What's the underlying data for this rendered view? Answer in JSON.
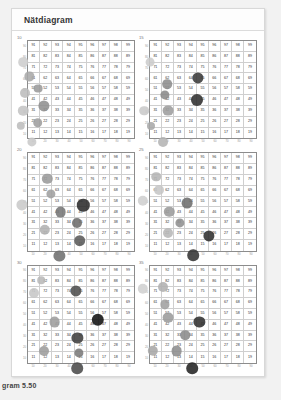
{
  "page": {
    "background": "#f2f2f2",
    "card_background": "#ffffff"
  },
  "header": {
    "title": "Nätdiagram"
  },
  "caption": {
    "text": "gram 5.50"
  },
  "grid_numbers": {
    "rows": [
      [
        91,
        92,
        93,
        94,
        95,
        96,
        97,
        98,
        99
      ],
      [
        81,
        82,
        83,
        84,
        85,
        86,
        87,
        88,
        89
      ],
      [
        71,
        72,
        73,
        74,
        75,
        76,
        77,
        78,
        79
      ],
      [
        61,
        62,
        63,
        64,
        65,
        66,
        67,
        68,
        69
      ],
      [
        51,
        52,
        53,
        54,
        55,
        56,
        57,
        58,
        59
      ],
      [
        41,
        42,
        43,
        44,
        45,
        46,
        47,
        48,
        49
      ],
      [
        31,
        32,
        33,
        34,
        35,
        36,
        37,
        38,
        39
      ],
      [
        21,
        22,
        23,
        24,
        25,
        26,
        27,
        28,
        29
      ],
      [
        11,
        12,
        13,
        14,
        15,
        16,
        17,
        18,
        19
      ]
    ]
  },
  "axes": {
    "y_ticks": [
      "90",
      "80",
      "70",
      "60",
      "50",
      "40",
      "30",
      "20",
      "10"
    ],
    "x_ticks": [
      "10",
      "20",
      "30",
      "40",
      "50",
      "60",
      "70",
      "80",
      "90"
    ]
  },
  "chart_data": {
    "type": "scatter",
    "title": "Nätdiagram",
    "xlabel": "",
    "ylabel": "",
    "xlim": [
      10,
      100
    ],
    "ylim": [
      10,
      100
    ],
    "grid": true,
    "legend": "none",
    "note": "Six small multiples of a 9x9 number grid (11-99) with bubbles of varying size and darkness overlaid.",
    "panels": [
      {
        "label": "10",
        "bubbles": [
          {
            "cx": 14,
            "cy": 8,
            "r": 4.6,
            "color": "#c9c9c9"
          },
          {
            "cx": 5,
            "cy": 22,
            "r": 4.2,
            "color": "#bdbdbd"
          },
          {
            "cx": 19,
            "cy": 25,
            "r": 4.8,
            "color": "#9e9e9e"
          },
          {
            "cx": 7,
            "cy": 36,
            "r": 5.2,
            "color": "#c4c4c4"
          },
          {
            "cx": 24,
            "cy": 40,
            "r": 5.6,
            "color": "#8f8f8f"
          },
          {
            "cx": 8,
            "cy": 52,
            "r": 5.0,
            "color": "#bcbcbc"
          },
          {
            "cx": 19,
            "cy": 56,
            "r": 4.4,
            "color": "#9a9a9a"
          },
          {
            "cx": 12,
            "cy": 67,
            "r": 4.6,
            "color": "#a8a8a8"
          },
          {
            "cx": 7,
            "cy": 80,
            "r": 4.8,
            "color": "#cdcdcd"
          }
        ]
      },
      {
        "label": "15",
        "bubbles": [
          {
            "cx": 22,
            "cy": 8,
            "r": 5.0,
            "color": "#b4b4b4"
          },
          {
            "cx": 12,
            "cy": 22,
            "r": 4.0,
            "color": "#a9a9a9"
          },
          {
            "cx": 6,
            "cy": 36,
            "r": 4.8,
            "color": "#c9c9c9"
          },
          {
            "cx": 26,
            "cy": 36,
            "r": 5.4,
            "color": "#9d9d9d"
          },
          {
            "cx": 23,
            "cy": 50,
            "r": 4.6,
            "color": "#8a8a8a"
          },
          {
            "cx": 50,
            "cy": 46,
            "r": 6.0,
            "color": "#2f2f2f"
          },
          {
            "cx": 25,
            "cy": 60,
            "r": 4.8,
            "color": "#8d8d8d"
          },
          {
            "cx": 51,
            "cy": 66,
            "r": 5.6,
            "color": "#3a3a3a"
          },
          {
            "cx": 11,
            "cy": 80,
            "r": 4.4,
            "color": "#cccccc"
          }
        ]
      },
      {
        "label": "20",
        "bubbles": [
          {
            "cx": 37,
            "cy": 6,
            "r": 5.6,
            "color": "#6f6f6f"
          },
          {
            "cx": 54,
            "cy": 20,
            "r": 5.8,
            "color": "#5a5a5a"
          },
          {
            "cx": 25,
            "cy": 30,
            "r": 5.2,
            "color": "#b2b2b2"
          },
          {
            "cx": 52,
            "cy": 36,
            "r": 5.0,
            "color": "#6c6c6c"
          },
          {
            "cx": 38,
            "cy": 46,
            "r": 5.4,
            "color": "#767676"
          },
          {
            "cx": 6,
            "cy": 52,
            "r": 5.6,
            "color": "#cacaca"
          },
          {
            "cx": 57,
            "cy": 52,
            "r": 6.2,
            "color": "#2b2b2b"
          },
          {
            "cx": 30,
            "cy": 62,
            "r": 4.6,
            "color": "#9f9f9f"
          },
          {
            "cx": 27,
            "cy": 76,
            "r": 5.2,
            "color": "#9a9a9a"
          }
        ]
      },
      {
        "label": "25",
        "bubbles": [
          {
            "cx": 47,
            "cy": 7,
            "r": 5.8,
            "color": "#333333"
          },
          {
            "cx": 26,
            "cy": 27,
            "r": 5.0,
            "color": "#b7b7b7"
          },
          {
            "cx": 60,
            "cy": 24,
            "r": 5.6,
            "color": "#2e2e2e"
          },
          {
            "cx": 36,
            "cy": 36,
            "r": 4.6,
            "color": "#8f8f8f"
          },
          {
            "cx": 27,
            "cy": 46,
            "r": 5.2,
            "color": "#9b9b9b"
          },
          {
            "cx": 42,
            "cy": 54,
            "r": 5.4,
            "color": "#6d6d6d"
          },
          {
            "cx": 5,
            "cy": 56,
            "r": 5.2,
            "color": "#cfcfcf"
          },
          {
            "cx": 18,
            "cy": 66,
            "r": 5.0,
            "color": "#c6c6c6"
          },
          {
            "cx": 16,
            "cy": 78,
            "r": 4.8,
            "color": "#b5b5b5"
          }
        ]
      },
      {
        "label": "30",
        "bubbles": [
          {
            "cx": 52,
            "cy": 6,
            "r": 5.8,
            "color": "#4a4a4a"
          },
          {
            "cx": 24,
            "cy": 22,
            "r": 5.0,
            "color": "#9c9c9c"
          },
          {
            "cx": 53,
            "cy": 20,
            "r": 4.6,
            "color": "#7a7a7a"
          },
          {
            "cx": 52,
            "cy": 34,
            "r": 5.6,
            "color": "#3f3f3f"
          },
          {
            "cx": 33,
            "cy": 48,
            "r": 5.4,
            "color": "#9d9d9d"
          },
          {
            "cx": 69,
            "cy": 50,
            "r": 6.2,
            "color": "#111111"
          },
          {
            "cx": 16,
            "cy": 74,
            "r": 5.0,
            "color": "#c6c6c6"
          },
          {
            "cx": 51,
            "cy": 76,
            "r": 5.6,
            "color": "#4d4d4d"
          },
          {
            "cx": 22,
            "cy": 86,
            "r": 3.8,
            "color": "#b8b8b8"
          }
        ]
      },
      {
        "label": "35",
        "bubbles": [
          {
            "cx": 46,
            "cy": 6,
            "r": 5.8,
            "color": "#232323"
          },
          {
            "cx": 13,
            "cy": 22,
            "r": 5.2,
            "color": "#a7a7a7"
          },
          {
            "cx": 33,
            "cy": 22,
            "r": 5.4,
            "color": "#8d8d8d"
          },
          {
            "cx": 40,
            "cy": 36,
            "r": 4.8,
            "color": "#8a8a8a"
          },
          {
            "cx": 52,
            "cy": 48,
            "r": 5.6,
            "color": "#303030"
          },
          {
            "cx": 26,
            "cy": 52,
            "r": 5.4,
            "color": "#9b9b9b"
          },
          {
            "cx": 23,
            "cy": 64,
            "r": 4.6,
            "color": "#a0a0a0"
          },
          {
            "cx": 5,
            "cy": 78,
            "r": 5.2,
            "color": "#d0d0d0"
          },
          {
            "cx": 22,
            "cy": 80,
            "r": 5.0,
            "color": "#b0b0b0"
          }
        ]
      }
    ]
  }
}
